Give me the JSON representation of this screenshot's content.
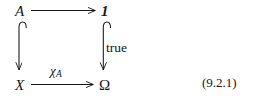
{
  "figure": {
    "kind": "commutative-diagram",
    "caption_number": "(9.2.1)",
    "ink_color": "#15161a",
    "nodes": {
      "top_left": "A",
      "top_right": "1",
      "bottom_left": "X",
      "bottom_right": "Ω"
    },
    "edges": {
      "top": {
        "label": "",
        "from": "A",
        "to": "1",
        "style": "plain-arrow",
        "direction": "right"
      },
      "left": {
        "label": "",
        "from": "A",
        "to": "X",
        "style": "hooked-arrow",
        "direction": "down"
      },
      "right": {
        "label": "true",
        "from": "1",
        "to": "Ω",
        "style": "hooked-arrow",
        "direction": "down"
      },
      "bottom": {
        "label_symbol": "χ",
        "label_subscript": "A",
        "from": "X",
        "to": "Ω",
        "style": "plain-arrow",
        "direction": "right"
      }
    }
  }
}
